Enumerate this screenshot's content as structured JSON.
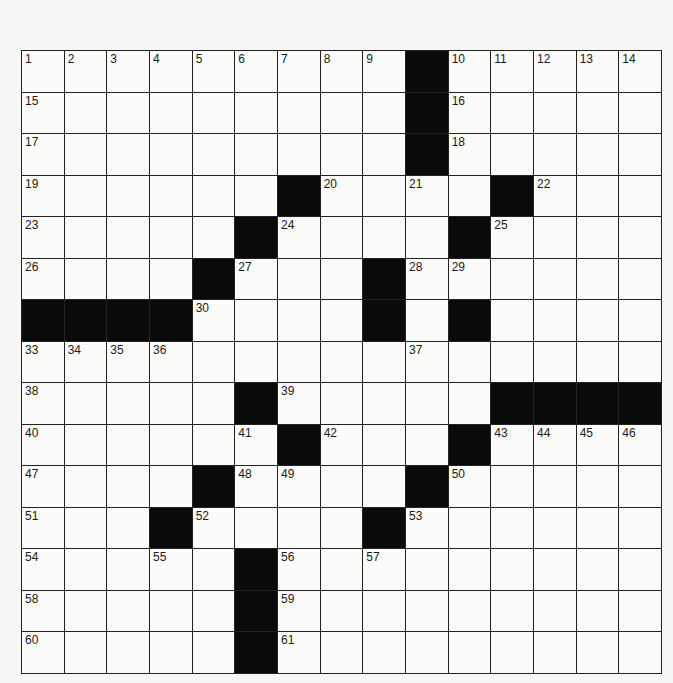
{
  "puzzle": {
    "type": "crossword",
    "rows": 15,
    "cols": 15,
    "layout": [
      "#########X#####",
      "#########X#####",
      "#########X#####",
      "######X####X###",
      "#####X####X####",
      "####X###X######",
      "XXXX####X#X####",
      "###############",
      "#####X#####XXXX",
      "######X###X####",
      "####X####X#####",
      "###X####X######",
      "#####X#########",
      "#####X#########",
      "#####X#########"
    ],
    "numbers": [
      {
        "r": 0,
        "c": 0,
        "n": "1"
      },
      {
        "r": 0,
        "c": 1,
        "n": "2"
      },
      {
        "r": 0,
        "c": 2,
        "n": "3"
      },
      {
        "r": 0,
        "c": 3,
        "n": "4"
      },
      {
        "r": 0,
        "c": 4,
        "n": "5"
      },
      {
        "r": 0,
        "c": 5,
        "n": "6"
      },
      {
        "r": 0,
        "c": 6,
        "n": "7"
      },
      {
        "r": 0,
        "c": 7,
        "n": "8"
      },
      {
        "r": 0,
        "c": 8,
        "n": "9"
      },
      {
        "r": 0,
        "c": 10,
        "n": "10"
      },
      {
        "r": 0,
        "c": 11,
        "n": "11"
      },
      {
        "r": 0,
        "c": 12,
        "n": "12"
      },
      {
        "r": 0,
        "c": 13,
        "n": "13"
      },
      {
        "r": 0,
        "c": 14,
        "n": "14"
      },
      {
        "r": 1,
        "c": 0,
        "n": "15"
      },
      {
        "r": 1,
        "c": 10,
        "n": "16"
      },
      {
        "r": 2,
        "c": 0,
        "n": "17"
      },
      {
        "r": 2,
        "c": 10,
        "n": "18"
      },
      {
        "r": 3,
        "c": 0,
        "n": "19"
      },
      {
        "r": 3,
        "c": 7,
        "n": "20"
      },
      {
        "r": 3,
        "c": 9,
        "n": "21"
      },
      {
        "r": 3,
        "c": 12,
        "n": "22"
      },
      {
        "r": 4,
        "c": 0,
        "n": "23"
      },
      {
        "r": 4,
        "c": 6,
        "n": "24"
      },
      {
        "r": 4,
        "c": 11,
        "n": "25"
      },
      {
        "r": 5,
        "c": 0,
        "n": "26"
      },
      {
        "r": 5,
        "c": 5,
        "n": "27"
      },
      {
        "r": 5,
        "c": 9,
        "n": "28"
      },
      {
        "r": 5,
        "c": 10,
        "n": "29"
      },
      {
        "r": 6,
        "c": 4,
        "n": "30"
      },
      {
        "r": 6,
        "c": 8,
        "n": "31"
      },
      {
        "r": 6,
        "c": 10,
        "n": "32"
      },
      {
        "r": 7,
        "c": 0,
        "n": "33"
      },
      {
        "r": 7,
        "c": 1,
        "n": "34"
      },
      {
        "r": 7,
        "c": 2,
        "n": "35"
      },
      {
        "r": 7,
        "c": 3,
        "n": "36"
      },
      {
        "r": 7,
        "c": 9,
        "n": "37"
      },
      {
        "r": 8,
        "c": 0,
        "n": "38"
      },
      {
        "r": 8,
        "c": 6,
        "n": "39"
      },
      {
        "r": 9,
        "c": 0,
        "n": "40"
      },
      {
        "r": 9,
        "c": 5,
        "n": "41"
      },
      {
        "r": 9,
        "c": 7,
        "n": "42"
      },
      {
        "r": 9,
        "c": 11,
        "n": "43"
      },
      {
        "r": 9,
        "c": 12,
        "n": "44"
      },
      {
        "r": 9,
        "c": 13,
        "n": "45"
      },
      {
        "r": 9,
        "c": 14,
        "n": "46"
      },
      {
        "r": 10,
        "c": 0,
        "n": "47"
      },
      {
        "r": 10,
        "c": 5,
        "n": "48"
      },
      {
        "r": 10,
        "c": 6,
        "n": "49"
      },
      {
        "r": 10,
        "c": 10,
        "n": "50"
      },
      {
        "r": 11,
        "c": 0,
        "n": "51"
      },
      {
        "r": 11,
        "c": 4,
        "n": "52"
      },
      {
        "r": 11,
        "c": 9,
        "n": "53"
      },
      {
        "r": 12,
        "c": 0,
        "n": "54"
      },
      {
        "r": 12,
        "c": 3,
        "n": "55"
      },
      {
        "r": 12,
        "c": 6,
        "n": "56"
      },
      {
        "r": 12,
        "c": 8,
        "n": "57"
      },
      {
        "r": 13,
        "c": 0,
        "n": "58"
      },
      {
        "r": 13,
        "c": 6,
        "n": "59"
      },
      {
        "r": 14,
        "c": 0,
        "n": "60"
      },
      {
        "r": 14,
        "c": 6,
        "n": "61"
      }
    ],
    "colors": {
      "block": "#0a0a0a",
      "cell": "#fbfbf9",
      "line": "#222222"
    }
  }
}
